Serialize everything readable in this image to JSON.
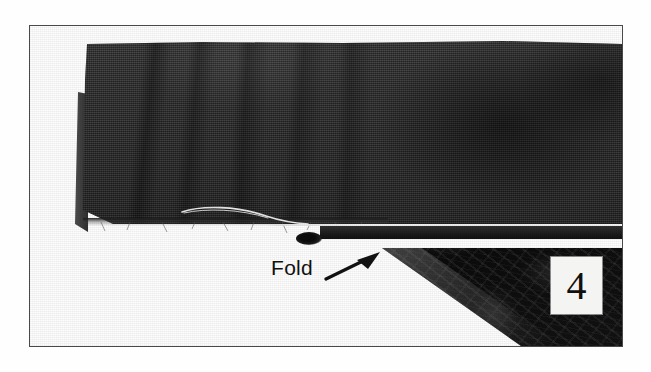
{
  "figure": {
    "kind": "instructional-photograph",
    "border_color": "#4a4a4a",
    "background_color": "#ffffff"
  },
  "annotations": {
    "fold_label": "Fold",
    "fold_arrow_icon": "arrow-up-right-icon",
    "arrow_color": "#111111"
  },
  "step": {
    "number": "4",
    "box_background": "#f4f4f2",
    "text_color": "#101010"
  },
  "photo_elements": {
    "top_fabric_name": "folded fabric band",
    "under_fabric_name": "dark patterned fabric beneath the fold",
    "stitch_line_name": "white stitching thread",
    "raw_edge_name": "raw cut fabric edge",
    "thread_tail_name": "loose thread tail",
    "colors": {
      "top_fabric": "#2e2e2e",
      "under_fabric": "#0d0d0d",
      "stitch_thread": "#f0f0f0"
    }
  }
}
